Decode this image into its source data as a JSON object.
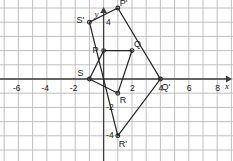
{
  "figure": {
    "kind": "coordinate-grid-geometry-diagram",
    "axis_label_x": "x",
    "axis_label_y": "y",
    "grid": {
      "spacing_units": 1,
      "grid_color": "#b9b9b9",
      "axis_color": "#3d3d3d",
      "shape_color": "#262626",
      "background": "#ffffff",
      "x_min": -9,
      "x_max": 11,
      "y_min": -7,
      "y_max": 6
    },
    "x_ticks": [
      "-8",
      "-6",
      "-4",
      "-2",
      "2",
      "4",
      "6",
      "8",
      "10"
    ],
    "x_tick_values": [
      -8,
      -6,
      -4,
      -2,
      2,
      4,
      6,
      8,
      10
    ],
    "y_ticks": [
      "4",
      "-2",
      "-4",
      "-6"
    ],
    "y_tick_values": [
      4,
      -2,
      -4,
      -6
    ],
    "points": [
      {
        "label": "P",
        "x": 0,
        "y": 2,
        "label_dx": -11,
        "label_dy": -5
      },
      {
        "label": "Q",
        "x": 2,
        "y": 2,
        "label_dx": 2,
        "label_dy": -11
      },
      {
        "label": "R",
        "x": 1,
        "y": -1,
        "label_dx": 2,
        "label_dy": 3
      },
      {
        "label": "S",
        "x": -1,
        "y": 0,
        "label_dx": -12,
        "label_dy": -10
      },
      {
        "label": "P'",
        "x": 1,
        "y": 5,
        "label_dx": 2,
        "label_dy": -9
      },
      {
        "label": "Q'",
        "x": 4,
        "y": 0,
        "label_dx": 1,
        "label_dy": 4
      },
      {
        "label": "R'",
        "x": 1,
        "y": -4,
        "label_dx": 1,
        "label_dy": 4
      },
      {
        "label": "S'",
        "x": -1,
        "y": 4,
        "label_dx": -13,
        "label_dy": -6
      }
    ],
    "polygons": [
      {
        "name": "preimage-PQRS",
        "vertices": [
          [
            0,
            2
          ],
          [
            2,
            2
          ],
          [
            1,
            -1
          ],
          [
            -1,
            0
          ]
        ]
      },
      {
        "name": "image-PQRSprime",
        "vertices": [
          [
            1,
            5
          ],
          [
            4,
            0
          ],
          [
            1,
            -4
          ],
          [
            -1,
            4
          ]
        ]
      }
    ]
  }
}
